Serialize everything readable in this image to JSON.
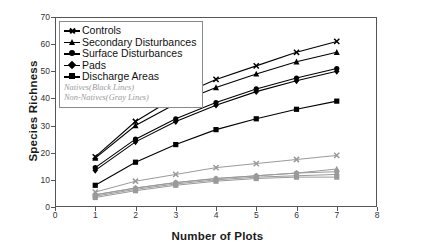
{
  "chart_data": {
    "type": "line",
    "title": "",
    "xlabel": "Number of Plots",
    "ylabel": "Species Richness",
    "xlim": [
      0,
      8
    ],
    "ylim": [
      0,
      70
    ],
    "xticks": [
      0,
      1,
      2,
      3,
      4,
      5,
      6,
      7,
      8
    ],
    "yticks": [
      0,
      10,
      20,
      30,
      40,
      50,
      60,
      70
    ],
    "grid": false,
    "legend_position": "top-left",
    "x": [
      1,
      2,
      3,
      4,
      5,
      6,
      7
    ],
    "series": [
      {
        "name": "Controls",
        "group": "Natives",
        "color": "#000000",
        "marker": "x",
        "values": [
          18.5,
          31.5,
          40.5,
          47.0,
          52.0,
          57.0,
          61.0
        ]
      },
      {
        "name": "Secondary Disturbances",
        "group": "Natives",
        "color": "#000000",
        "marker": "triangle",
        "values": [
          18.0,
          30.0,
          38.0,
          44.0,
          49.0,
          53.5,
          57.0
        ]
      },
      {
        "name": "Surface Disturbances",
        "group": "Natives",
        "color": "#000000",
        "marker": "circle",
        "values": [
          14.5,
          25.0,
          32.5,
          38.5,
          43.5,
          47.5,
          51.0
        ]
      },
      {
        "name": "Pads",
        "group": "Natives",
        "color": "#000000",
        "marker": "diamond",
        "values": [
          13.5,
          24.0,
          31.5,
          37.5,
          42.5,
          46.5,
          50.0
        ]
      },
      {
        "name": "Discharge Areas",
        "group": "Natives",
        "color": "#000000",
        "marker": "square",
        "values": [
          8.0,
          16.5,
          23.0,
          28.5,
          32.5,
          36.0,
          39.0
        ]
      },
      {
        "name": "Controls",
        "group": "Non-Natives",
        "color": "#9a9a9a",
        "marker": "x",
        "values": [
          5.5,
          9.5,
          12.0,
          14.5,
          16.0,
          17.5,
          19.0
        ]
      },
      {
        "name": "Secondary Disturbances",
        "group": "Non-Natives",
        "color": "#9a9a9a",
        "marker": "triangle",
        "values": [
          4.5,
          7.0,
          9.0,
          10.5,
          11.5,
          12.5,
          14.0
        ]
      },
      {
        "name": "Surface Disturbances",
        "group": "Non-Natives",
        "color": "#9a9a9a",
        "marker": "circle",
        "values": [
          4.5,
          7.0,
          9.0,
          10.5,
          11.5,
          12.5,
          13.0
        ]
      },
      {
        "name": "Pads",
        "group": "Non-Natives",
        "color": "#9a9a9a",
        "marker": "diamond",
        "values": [
          4.0,
          6.5,
          8.5,
          10.0,
          11.0,
          11.5,
          12.0
        ]
      },
      {
        "name": "Discharge Areas",
        "group": "Non-Natives",
        "color": "#9a9a9a",
        "marker": "square",
        "values": [
          3.5,
          6.0,
          8.0,
          9.5,
          10.5,
          11.0,
          11.0
        ]
      }
    ],
    "annotations": []
  },
  "legend": {
    "items": [
      {
        "label": "Controls",
        "marker": "x-marker"
      },
      {
        "label": "Secondary Disturbances",
        "marker": "triangle-marker"
      },
      {
        "label": "Surface Disturbances",
        "marker": "circle-marker"
      },
      {
        "label": "Pads",
        "marker": "diamond-marker"
      },
      {
        "label": "Discharge Areas",
        "marker": "square-marker"
      }
    ],
    "notes": [
      "Natives(Black Lines)",
      "Non-Natives(Gray Lines)"
    ]
  },
  "colors": {
    "natives": "#000000",
    "non_natives": "#9a9a9a",
    "axis": "#555555",
    "text": "#1a1a1a"
  }
}
